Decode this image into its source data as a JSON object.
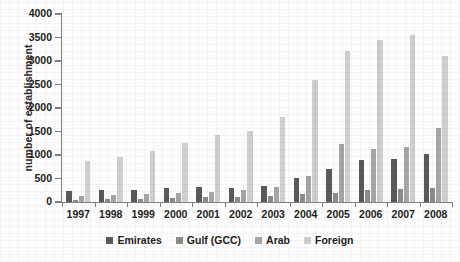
{
  "chart_data": {
    "type": "bar",
    "title": "",
    "xlabel": "",
    "ylabel": "number of establishment",
    "ylim": [
      0,
      4000
    ],
    "yticks": [
      0,
      500,
      1000,
      1500,
      2000,
      2500,
      3000,
      3500,
      4000
    ],
    "grid": false,
    "legend_position": "bottom",
    "categories": [
      "1997",
      "1998",
      "1999",
      "2000",
      "2001",
      "2002",
      "2003",
      "2004",
      "2005",
      "2006",
      "2007",
      "2008"
    ],
    "series": [
      {
        "name": "Emirates",
        "color": "#5a5a5a",
        "values": [
          230,
          255,
          250,
          290,
          320,
          300,
          340,
          520,
          700,
          890,
          920,
          1020
        ]
      },
      {
        "name": "Gulf (GCC)",
        "color": "#8c8c8c",
        "values": [
          50,
          60,
          70,
          85,
          100,
          110,
          120,
          160,
          200,
          250,
          280,
          300
        ]
      },
      {
        "name": "Arab",
        "color": "#a6a6a6",
        "values": [
          130,
          150,
          160,
          190,
          220,
          250,
          310,
          560,
          1230,
          1130,
          1160,
          1580
        ]
      },
      {
        "name": "Foreign",
        "color": "#cfcfcf",
        "values": [
          880,
          950,
          1090,
          1260,
          1420,
          1520,
          1810,
          2600,
          3210,
          3450,
          3560,
          3110
        ]
      }
    ]
  },
  "legend": {
    "items": [
      {
        "label": "Emirates"
      },
      {
        "label": "Gulf (GCC)"
      },
      {
        "label": "Arab"
      },
      {
        "label": "Foreign"
      }
    ]
  },
  "axis": {
    "y_title": "number of establishment"
  }
}
